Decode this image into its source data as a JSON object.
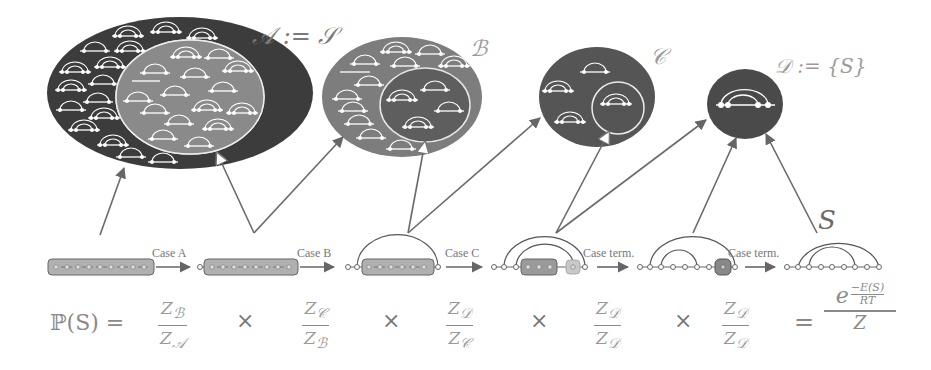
{
  "sets": [
    {
      "id": "A",
      "label": "𝒜 := 𝒮",
      "color": "#3c3c3c"
    },
    {
      "id": "B",
      "label": "ℬ",
      "color": "#7a7a7a"
    },
    {
      "id": "C",
      "label": "𝒞",
      "color": "#5a5a5a"
    },
    {
      "id": "D",
      "label": "𝒟 := {S}",
      "color": "#4a4a4a"
    }
  ],
  "cases": [
    {
      "label": "Case A"
    },
    {
      "label": "Case B"
    },
    {
      "label": "Case C"
    },
    {
      "label": "Case term."
    },
    {
      "label": "Case term."
    }
  ],
  "final_structure_label": "S",
  "formula": {
    "lhs": "ℙ(S) =",
    "fractions": [
      {
        "num": "Z",
        "num_sub": "ℬ",
        "den": "Z",
        "den_sub": "𝒜"
      },
      {
        "num": "Z",
        "num_sub": "𝒞",
        "den": "Z",
        "den_sub": "ℬ"
      },
      {
        "num": "Z",
        "num_sub": "𝒟",
        "den": "Z",
        "den_sub": "𝒞"
      },
      {
        "num": "Z",
        "num_sub": "𝒟",
        "den": "Z",
        "den_sub": "𝒟"
      },
      {
        "num": "Z",
        "num_sub": "𝒟",
        "den": "Z",
        "den_sub": "𝒟"
      }
    ],
    "times": "×",
    "equals": "=",
    "rhs": {
      "base": "e",
      "exp_num": "−E(S)",
      "exp_den": "RT",
      "den": "Z"
    }
  },
  "colors": {
    "set_dark": "#3a3a3a",
    "set_mid": "#6e6e6e",
    "set_light": "#8c8c8c",
    "arrow": "#6a6a6a",
    "box_fill": "#b0b0b0",
    "box_stroke": "#666666"
  }
}
